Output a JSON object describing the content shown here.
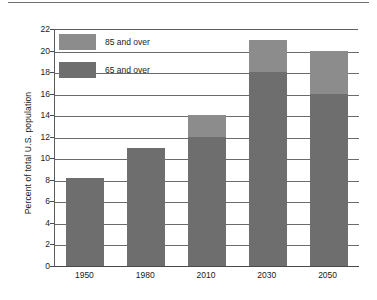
{
  "chart_data": {
    "type": "bar",
    "title": "",
    "subtitle": "",
    "xlabel": "",
    "ylabel": "Percent of total U.S. population",
    "categories": [
      "1950",
      "1980",
      "2010",
      "2030",
      "2050"
    ],
    "series": [
      {
        "name": "65 and over",
        "values": [
          8.2,
          11.0,
          12.0,
          18.0,
          16.0
        ],
        "color": "#6e6e6e"
      },
      {
        "name": "85 and over",
        "values": [
          0,
          0,
          2.0,
          3.0,
          4.0
        ],
        "color": "#8c8c8c"
      }
    ],
    "totals": [
      8.2,
      11.0,
      14.0,
      21.0,
      20.0
    ],
    "stacked": true,
    "ylim": [
      0,
      22
    ],
    "yticks": [
      0,
      2,
      4,
      6,
      8,
      10,
      12,
      14,
      16,
      18,
      20,
      22
    ],
    "ytick_labels": [
      "0",
      "2",
      "4",
      "6",
      "8",
      "10",
      "12",
      "14",
      "16",
      "18",
      "20",
      "22"
    ],
    "grid": true,
    "grid_axis": "y",
    "legend_position": "upper-left-inside",
    "legend": [
      {
        "label": "85 and over",
        "color": "#8c8c8c"
      },
      {
        "label": "65 and over",
        "color": "#6e6e6e"
      }
    ]
  },
  "colors": {
    "bar_upper": "#8c8c8c",
    "bar_lower": "#6e6e6e",
    "gridline": "#6b6b6b",
    "axis": "#4a4a4a",
    "text": "#1a1a1a",
    "background": "#ffffff",
    "top_rule": "#6f6f6f"
  }
}
